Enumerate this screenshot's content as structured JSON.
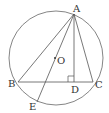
{
  "diagram": {
    "type": "geometry",
    "colors": {
      "stroke": "#555555",
      "text": "#333333",
      "background": "#ffffff"
    },
    "circle": {
      "center": "O",
      "cx": 56,
      "cy": 58,
      "r": 47
    },
    "points": {
      "A": {
        "label": "A",
        "x": 74,
        "y": 14
      },
      "B": {
        "label": "B",
        "x": 18,
        "y": 82
      },
      "C": {
        "label": "C",
        "x": 93,
        "y": 82
      },
      "D": {
        "label": "D",
        "x": 74,
        "y": 82
      },
      "E": {
        "label": "E",
        "x": 37,
        "y": 102
      },
      "O": {
        "label": "O",
        "x": 56,
        "y": 59
      }
    },
    "segments": [
      "AB",
      "AC",
      "BC",
      "AD",
      "AE"
    ],
    "right_angle_at": "D"
  }
}
